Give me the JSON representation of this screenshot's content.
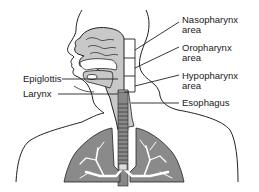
{
  "diagram": {
    "type": "anatomical illustration",
    "colors": {
      "tissue_fill": "#c8c8c8",
      "lung_fill": "#8a8a8a",
      "airway_white": "#ffffff",
      "outline": "#222222",
      "trachea_dark": "#555555"
    }
  },
  "labels": {
    "nasopharynx": {
      "line1": "Nasopharynx",
      "line2": "area"
    },
    "oropharynx": {
      "line1": "Oropharynx",
      "line2": "area"
    },
    "hypopharynx": {
      "line1": "Hypopharynx",
      "line2": "area"
    },
    "esophagus": "Esophagus",
    "epiglottis": "Epiglottis",
    "larynx": "Larynx"
  }
}
